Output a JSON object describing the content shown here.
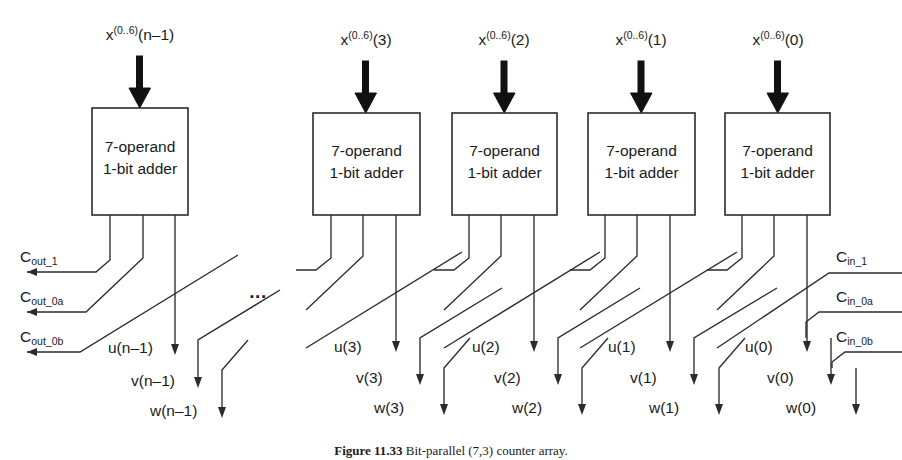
{
  "figure": {
    "caption_label": "Figure 11.33",
    "caption_text": "Bit-parallel (7,3) counter array.",
    "ellipsis": "...",
    "colors": {
      "ink": "#2b2b2b",
      "background": "#ffffff",
      "arrow_fill": "#111111"
    }
  },
  "blocks": [
    {
      "id": "adder-n-1",
      "line1": "7-operand",
      "line2": "1-bit adder",
      "input_label_base": "x",
      "input_label_sup": "(0..6)",
      "input_label_index": "(n–1)",
      "outputs": {
        "u": "u(n–1)",
        "v": "v(n–1)",
        "w": "w(n–1)"
      }
    },
    {
      "id": "adder-3",
      "line1": "7-operand",
      "line2": "1-bit adder",
      "input_label_base": "x",
      "input_label_sup": "(0..6)",
      "input_label_index": "(3)",
      "outputs": {
        "u": "u(3)",
        "v": "v(3)",
        "w": "w(3)"
      }
    },
    {
      "id": "adder-2",
      "line1": "7-operand",
      "line2": "1-bit adder",
      "input_label_base": "x",
      "input_label_sup": "(0..6)",
      "input_label_index": "(2)",
      "outputs": {
        "u": "u(2)",
        "v": "v(2)",
        "w": "w(2)"
      }
    },
    {
      "id": "adder-1",
      "line1": "7-operand",
      "line2": "1-bit adder",
      "input_label_base": "x",
      "input_label_sup": "(0..6)",
      "input_label_index": "(1)",
      "outputs": {
        "u": "u(1)",
        "v": "v(1)",
        "w": "w(1)"
      }
    },
    {
      "id": "adder-0",
      "line1": "7-operand",
      "line2": "1-bit adder",
      "input_label_base": "x",
      "input_label_sup": "(0..6)",
      "input_label_index": "(0)",
      "outputs": {
        "u": "u(0)",
        "v": "v(0)",
        "w": "w(0)"
      }
    }
  ],
  "carry_out": [
    {
      "id": "cout-1",
      "base": "C",
      "sub": "out_1"
    },
    {
      "id": "cout-0a",
      "base": "C",
      "sub": "out_0a"
    },
    {
      "id": "cout-0b",
      "base": "C",
      "sub": "out_0b"
    }
  ],
  "carry_in": [
    {
      "id": "cin-1",
      "base": "C",
      "sub": "in_1"
    },
    {
      "id": "cin-0a",
      "base": "C",
      "sub": "in_0a"
    },
    {
      "id": "cin-0b",
      "base": "C",
      "sub": "in_0b"
    }
  ]
}
